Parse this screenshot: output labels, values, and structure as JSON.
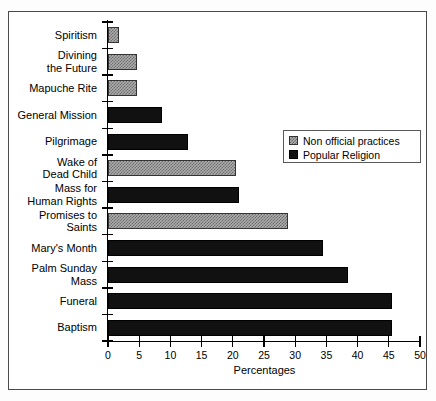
{
  "chart_data": {
    "type": "bar",
    "orientation": "horizontal",
    "title": "",
    "xlabel": "Percentages",
    "ylabel": "",
    "xlim": [
      0,
      50
    ],
    "xticks": [
      0,
      5,
      10,
      15,
      20,
      25,
      30,
      35,
      40,
      45,
      50
    ],
    "grid": false,
    "legend_position": "upper right",
    "categories": [
      "Spiritism",
      "Divining\nthe Future",
      "Mapuche Rite",
      "General Mission",
      "Pilgrimage",
      "Wake of\nDead Child",
      "Mass for\nHuman Rights",
      "Promises to\nSaints",
      "Mary's Month",
      "Palm Sunday\nMass",
      "Funeral",
      "Baptism"
    ],
    "values": [
      1.8,
      4.6,
      4.6,
      8.7,
      12.8,
      20.5,
      21.0,
      28.8,
      34.5,
      38.5,
      45.5,
      45.5
    ],
    "series_of_bar": [
      "Non official practices",
      "Non official practices",
      "Non official practices",
      "Popular Religion",
      "Popular Religion",
      "Non official practices",
      "Popular Religion",
      "Non official practices",
      "Popular Religion",
      "Popular Religion",
      "Popular Religion",
      "Popular Religion"
    ],
    "legend": [
      {
        "label": "Non official practices",
        "style": "hatch",
        "color": "#adadad"
      },
      {
        "label": "Popular Religion",
        "style": "solid",
        "color": "#111111"
      }
    ]
  }
}
